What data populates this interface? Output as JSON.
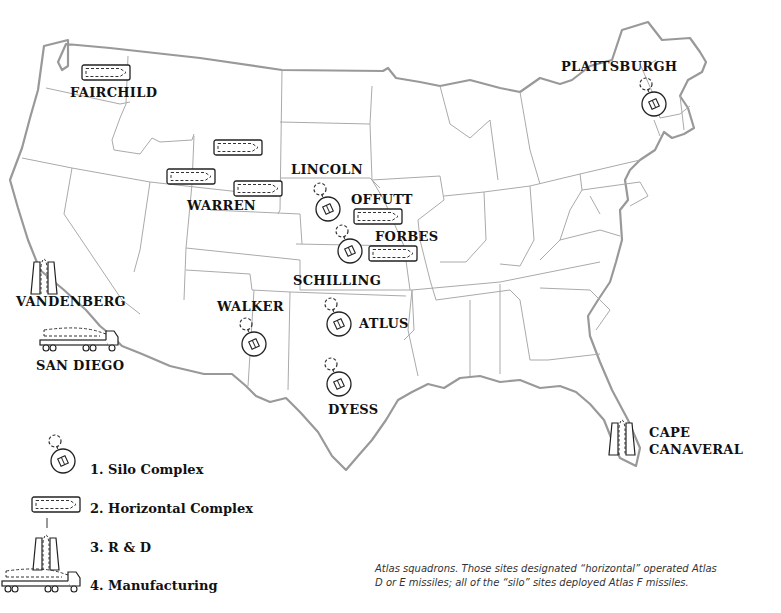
{
  "map": {
    "title": "Atlas missile sites",
    "colors": {
      "border": "#999999",
      "state_line": "#aaaaaa",
      "icon": "#222222",
      "text": "#111111"
    },
    "sites": [
      {
        "name": "FAIRCHILD",
        "type": "horizontal"
      },
      {
        "name": "WARREN",
        "type": "horizontal"
      },
      {
        "name": "LINCOLN",
        "type": "silo"
      },
      {
        "name": "OFFUTT",
        "type": "horizontal"
      },
      {
        "name": "FORBES",
        "type": "horizontal"
      },
      {
        "name": "SCHILLING",
        "type": "silo"
      },
      {
        "name": "WALKER",
        "type": "silo"
      },
      {
        "name": "ATLUS",
        "type": "silo"
      },
      {
        "name": "DYESS",
        "type": "silo"
      },
      {
        "name": "PLATTSBURGH",
        "type": "silo"
      },
      {
        "name": "VANDENBERG",
        "type": "r_and_d"
      },
      {
        "name": "SAN DIEGO",
        "type": "manufacturing"
      },
      {
        "name": "CAPE",
        "type": "r_and_d"
      },
      {
        "name": "CANAVERAL",
        "type": "r_and_d"
      }
    ]
  },
  "legend": {
    "items": [
      {
        "label": "1. Silo Complex",
        "icon": "silo-icon"
      },
      {
        "label": "2. Horizontal Complex",
        "icon": "horizontal-complex-icon"
      },
      {
        "label": "3. R & D",
        "icon": "launch-tower-icon"
      },
      {
        "label": "4. Manufacturing",
        "icon": "transport-truck-icon"
      }
    ]
  },
  "caption": {
    "line1": "Atlas squadrons. Those sites designated “horizontal” operated Atlas",
    "line2": "D or E missiles; all of the “silo” sites deployed Atlas F missiles."
  }
}
